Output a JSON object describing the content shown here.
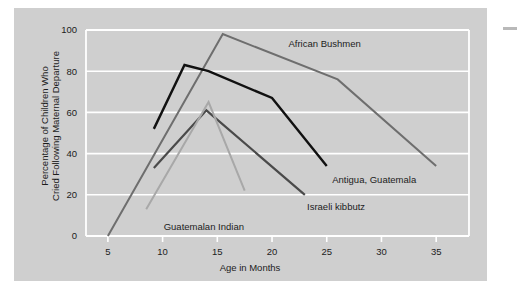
{
  "figure": {
    "background_color": "#ffffff",
    "panel_color": "#cfcfcf",
    "gridline_color": "#ffffff"
  },
  "chart_data": {
    "type": "line",
    "title": "",
    "xlabel": "Age in Months",
    "ylabel": "Percentage of Children Who Cried Following Maternal Departure",
    "ylabel_line1": "Percentage of Children Who",
    "ylabel_line2": "Cried Following Maternal Departure",
    "xlim": [
      3,
      38
    ],
    "ylim": [
      0,
      100
    ],
    "xticks": [
      5,
      10,
      15,
      20,
      25,
      30,
      35
    ],
    "xtick_labels": [
      "5",
      "10",
      "15",
      "20",
      "25",
      "30",
      "35"
    ],
    "yticks": [
      0,
      20,
      40,
      60,
      80,
      100
    ],
    "ytick_labels": [
      "0",
      "20",
      "40",
      "60",
      "80",
      "100"
    ],
    "grid": true,
    "grid_axis": "y",
    "legend": "inline-annotations",
    "series": [
      {
        "name": "African Bushmen",
        "color": "#6e6e6e",
        "linewidth": 2.0,
        "x": [
          5,
          15.5,
          26,
          35
        ],
        "values": [
          0,
          98,
          76,
          34
        ],
        "label_x": 21.5,
        "label_y": 93.5,
        "label_anchor": "start"
      },
      {
        "name": "Antigua, Guatemala",
        "color": "#111111",
        "linewidth": 2.4,
        "x": [
          9.2,
          12,
          14.2,
          20,
          25
        ],
        "values": [
          52,
          83,
          80,
          67,
          34
        ],
        "label_x": 25.5,
        "label_y": 27.5,
        "label_anchor": "start"
      },
      {
        "name": "Israeli kibbutz",
        "color": "#4a4a4a",
        "linewidth": 2.2,
        "x": [
          9.2,
          14,
          23
        ],
        "values": [
          33,
          61,
          20
        ],
        "label_x": 23.2,
        "label_y": 14.5,
        "label_anchor": "start"
      },
      {
        "name": "Guatemalan Indian",
        "color": "#a8a8a8",
        "linewidth": 2.0,
        "x": [
          8.5,
          14.2,
          17.5
        ],
        "values": [
          13,
          65,
          22
        ],
        "label_x": 10.1,
        "label_y": 4.5,
        "label_anchor": "start"
      }
    ]
  }
}
